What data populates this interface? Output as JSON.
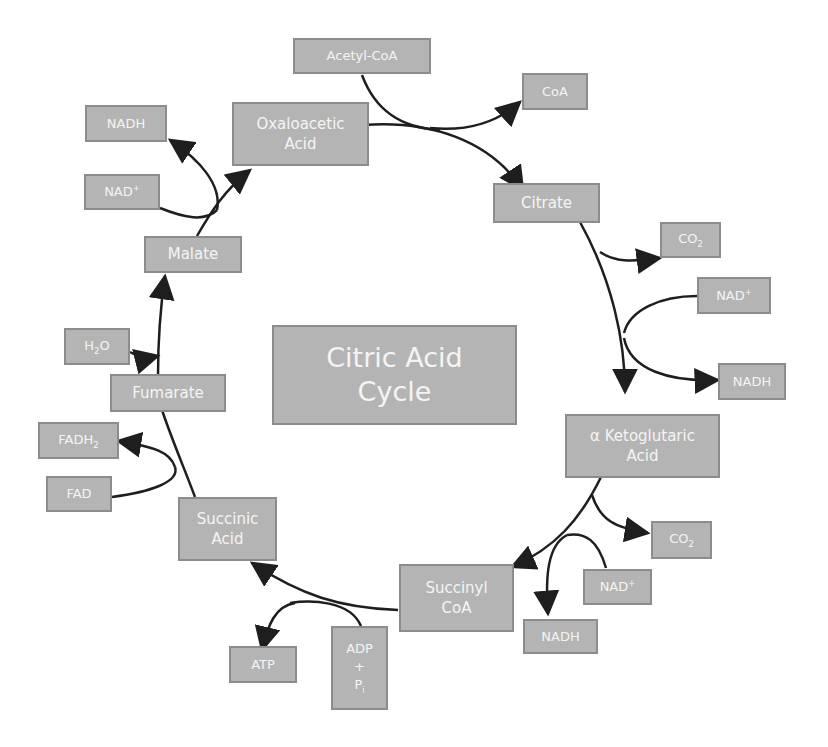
{
  "diagram": {
    "title": "Citric Acid Cycle",
    "title_lines": [
      "Citric Acid",
      "Cycle"
    ],
    "colors": {
      "box_fill": "#b4b4b4",
      "box_border": "#8c8c8c",
      "box_text": "#f4f4f4",
      "arrow": "#1e1e1e",
      "background": "#ffffff"
    },
    "cycle_intermediates": [
      {
        "id": "oxaloacetic-acid",
        "lines": [
          "Oxaloacetic",
          "Acid"
        ]
      },
      {
        "id": "citrate",
        "lines": [
          "Citrate"
        ]
      },
      {
        "id": "alpha-ketoglutaric-acid",
        "lines": [
          "α Ketoglutaric",
          "Acid"
        ]
      },
      {
        "id": "succinyl-coa",
        "lines": [
          "Succinyl",
          "CoA"
        ]
      },
      {
        "id": "succinic-acid",
        "lines": [
          "Succinic",
          "Acid"
        ]
      },
      {
        "id": "fumarate",
        "lines": [
          "Fumarate"
        ]
      },
      {
        "id": "malate",
        "lines": [
          "Malate"
        ]
      }
    ],
    "side_molecules": {
      "acetyl_coa": "Acetyl-CoA",
      "coa": "CoA",
      "co2_1": {
        "base": "CO",
        "sub": "2"
      },
      "nad_1": {
        "base": "NAD",
        "sup": "+"
      },
      "nadh_1": "NADH",
      "co2_2": {
        "base": "CO",
        "sub": "2"
      },
      "nad_2": {
        "base": "NAD",
        "sup": "+"
      },
      "nadh_2": "NADH",
      "adp_pi": {
        "line1": "ADP",
        "line2": "+",
        "line3_base": "P",
        "line3_sub": "i"
      },
      "atp": "ATP",
      "fad": "FAD",
      "fadh2": {
        "base": "FADH",
        "sub": "2"
      },
      "h2o": {
        "pre": "H",
        "sub": "2",
        "post": "O"
      },
      "nad_3": {
        "base": "NAD",
        "sup": "+"
      },
      "nadh_3": "NADH"
    },
    "reactions": [
      {
        "from": "Oxaloacetic Acid",
        "to": "Citrate",
        "inputs": [
          "Acetyl-CoA"
        ],
        "outputs": [
          "CoA"
        ]
      },
      {
        "from": "Citrate",
        "to": "α Ketoglutaric Acid",
        "inputs": [
          "NAD+"
        ],
        "outputs": [
          "CO2",
          "NADH"
        ]
      },
      {
        "from": "α Ketoglutaric Acid",
        "to": "Succinyl CoA",
        "inputs": [
          "NAD+"
        ],
        "outputs": [
          "CO2",
          "NADH"
        ]
      },
      {
        "from": "Succinyl CoA",
        "to": "Succinic Acid",
        "inputs": [
          "ADP + Pi"
        ],
        "outputs": [
          "ATP"
        ]
      },
      {
        "from": "Succinic Acid",
        "to": "Fumarate",
        "inputs": [
          "FAD"
        ],
        "outputs": [
          "FADH2"
        ]
      },
      {
        "from": "Fumarate",
        "to": "Malate",
        "inputs": [
          "H2O"
        ],
        "outputs": []
      },
      {
        "from": "Malate",
        "to": "Oxaloacetic Acid",
        "inputs": [
          "NAD+"
        ],
        "outputs": [
          "NADH"
        ]
      }
    ]
  }
}
